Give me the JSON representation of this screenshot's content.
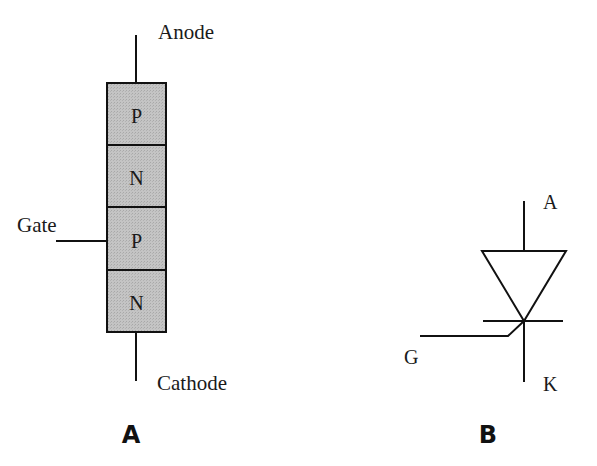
{
  "diagram_a": {
    "caption": "A",
    "terminals": {
      "anode": "Anode",
      "cathode": "Cathode",
      "gate": "Gate"
    },
    "layers": [
      {
        "label": "P"
      },
      {
        "label": "N"
      },
      {
        "label": "P"
      },
      {
        "label": "N"
      }
    ],
    "layer_fill": "#bdbdbd"
  },
  "diagram_b": {
    "caption": "B",
    "terminals": {
      "anode": "A",
      "cathode": "K",
      "gate": "G"
    }
  }
}
